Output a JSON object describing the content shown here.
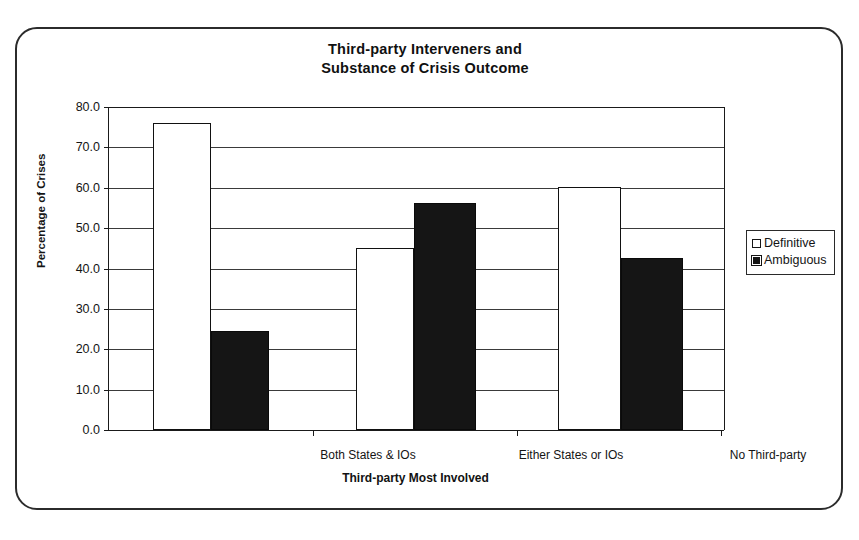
{
  "chart_data": {
    "type": "bar",
    "title": "Third-party Interveners and Substance of Crisis Outcome",
    "title_line1": "Third-party Interveners and",
    "title_line2": "Substance of Crisis Outcome",
    "xlabel": "Third-party Most Involved",
    "ylabel": "Percentage of Crises",
    "categories": [
      "Both States & IOs",
      "Either States or IOs",
      "No Third-party"
    ],
    "series": [
      {
        "name": "Definitive",
        "values": [
          76.0,
          45.2,
          60.2
        ],
        "color": "#ffffff"
      },
      {
        "name": "Ambiguous",
        "values": [
          24.5,
          56.2,
          42.5
        ],
        "color": "#151515"
      }
    ],
    "ylim": [
      0.0,
      80.0
    ],
    "ytick_labels": [
      "0.0",
      "10.0",
      "20.0",
      "30.0",
      "40.0",
      "50.0",
      "60.0",
      "70.0",
      "80.0"
    ],
    "ytick_values": [
      0.0,
      10.0,
      20.0,
      30.0,
      40.0,
      50.0,
      60.0,
      70.0,
      80.0
    ],
    "grid": true,
    "legend_position": "right"
  },
  "legend": {
    "items": [
      {
        "label": "Definitive",
        "swatch": "hollow-square-icon"
      },
      {
        "label": "Ambiguous",
        "swatch": "filled-square-icon"
      }
    ]
  }
}
